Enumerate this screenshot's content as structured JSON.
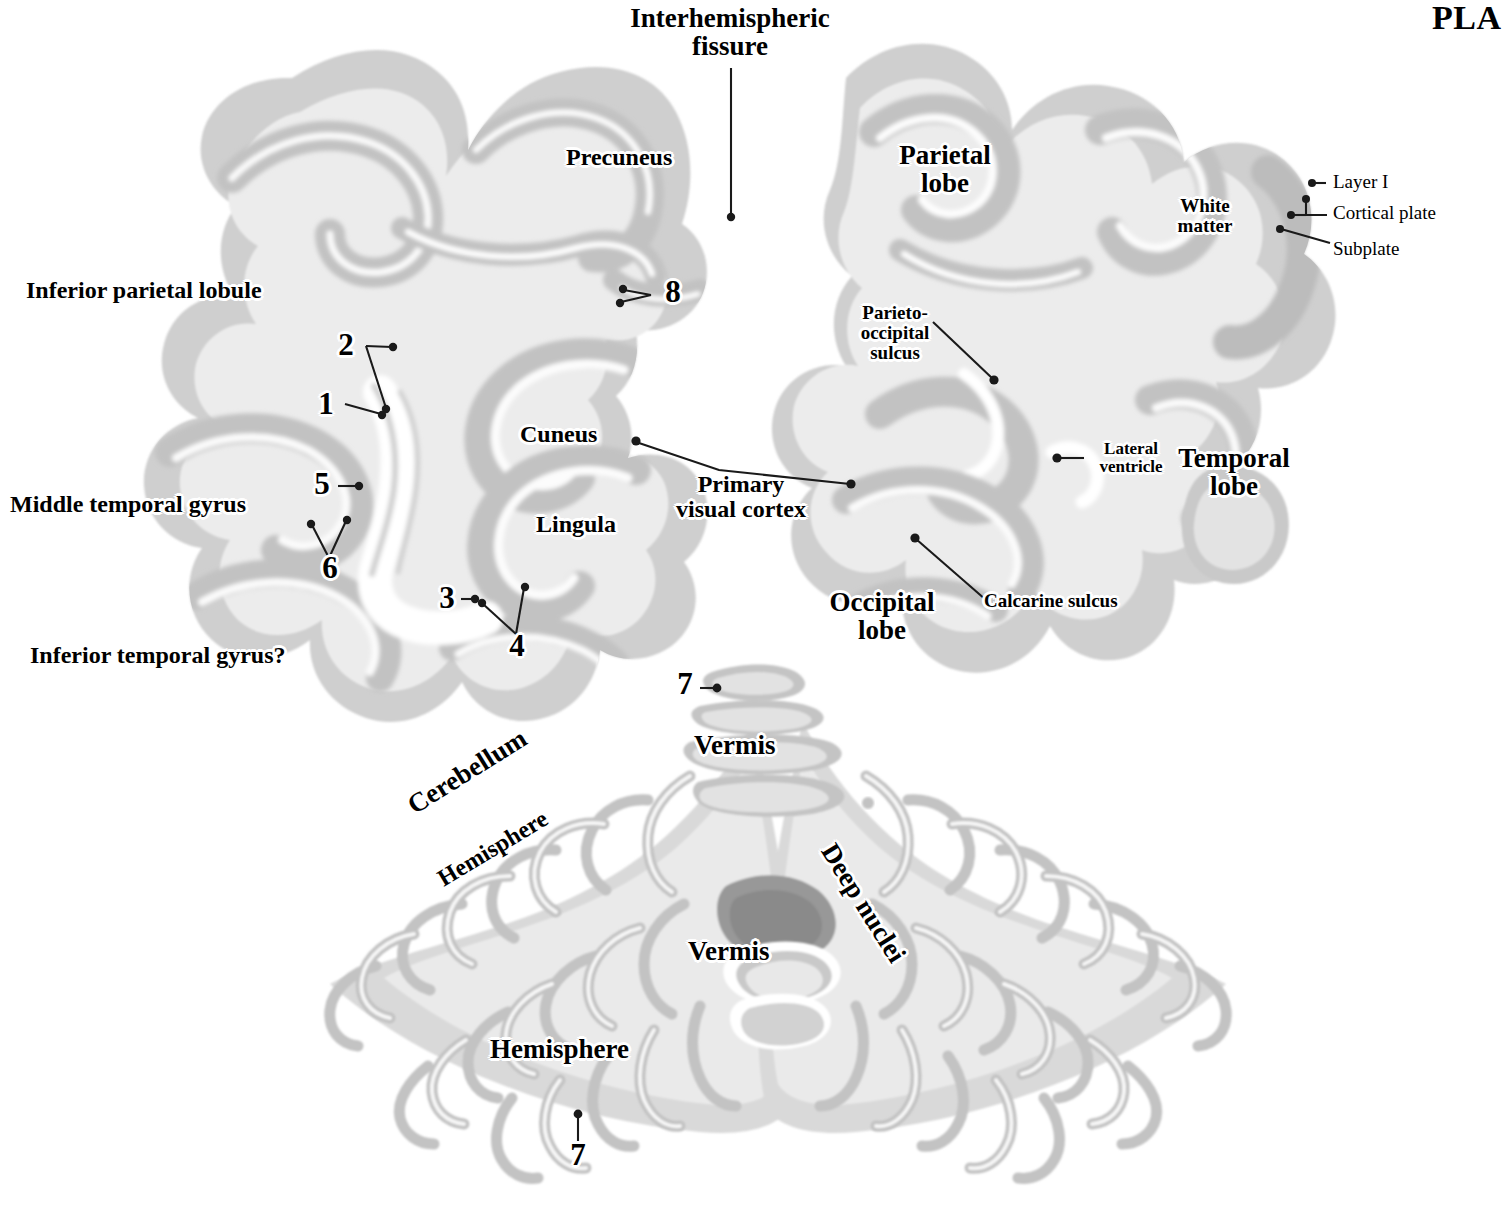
{
  "plate": {
    "title_partial": "PLA",
    "title_full_hint": "PLATE"
  },
  "figure": {
    "type": "histology-plate",
    "regions": [
      "left cerebral hemisphere",
      "right cerebral hemisphere",
      "cerebellum"
    ]
  },
  "labels": {
    "interhemispheric_fissure": "Interhemispheric\nfissure",
    "precuneus": "Precuneus",
    "parietal_lobe": "Parietal\nlobe",
    "white_matter": "White\nmatter",
    "layer_one": "Layer I",
    "cortical_plate": "Cortical plate",
    "subplate": "Subplate",
    "inferior_parietal_lobule": "Inferior parietal lobule",
    "parieto_occipital_sulcus": "Parieto-\noccipital\nsulcus",
    "cuneus": "Cuneus",
    "lateral_ventricle": "Lateral\nventricle",
    "temporal_lobe": "Temporal\nlobe",
    "middle_temporal_gyrus": "Middle temporal gyrus",
    "primary_visual_cortex": "Primary\nvisual cortex",
    "lingula": "Lingula",
    "occipital_lobe": "Occipital\nlobe",
    "calcarine_sulcus": "Calcarine sulcus",
    "inferior_temporal_gyrus": "Inferior temporal gyrus?",
    "cerebellum": "Cerebellum",
    "hemisphere_upper": "Hemisphere",
    "hemisphere_lower": "Hemisphere",
    "vermis_upper": "Vermis",
    "vermis_lower": "Vermis",
    "deep_nuclei": "Deep nuclei"
  },
  "numbered_markers": {
    "n1": "1",
    "n2": "2",
    "n3": "3",
    "n4": "4",
    "n5": "5",
    "n6": "6",
    "n7_upper": "7",
    "n7_lower": "7",
    "n8": "8"
  },
  "colors": {
    "background": "#ffffff",
    "white_matter": "#ececec",
    "cortical_ribbon": "#c5c5c5",
    "cortex_outer": "#d6d6d6",
    "deep_nuclei_dark": "#9a9a9a",
    "leader_line": "#1a1a1a",
    "text": "#000000"
  }
}
